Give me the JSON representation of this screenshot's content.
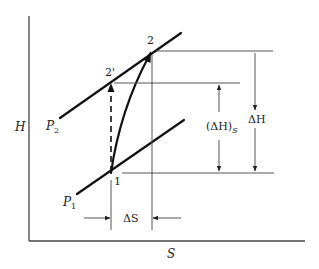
{
  "diagram": {
    "type": "enthalpy-entropy (H-S) compression diagram",
    "axes": {
      "x_label": "S",
      "y_label": "H"
    },
    "isobars": [
      {
        "label_main": "P",
        "label_sub": "2",
        "name": "P2"
      },
      {
        "label_main": "P",
        "label_sub": "1",
        "name": "P1"
      }
    ],
    "points": [
      {
        "label": "1"
      },
      {
        "label": "2"
      },
      {
        "label": "2'"
      }
    ],
    "dimensions": {
      "delta_H": "ΔH",
      "delta_H_s_main": "(ΔH)",
      "delta_H_s_sub": "S",
      "delta_S": "ΔS"
    },
    "paths": {
      "actual": "1 → 2 (curved, solid)",
      "isentropic": "1 → 2' (vertical, dashed)"
    }
  }
}
